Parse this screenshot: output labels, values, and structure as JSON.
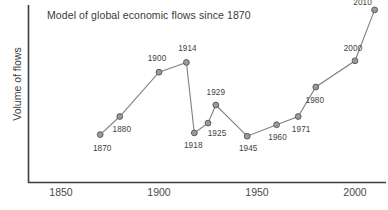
{
  "chart_data": {
    "type": "line",
    "title": "Model of global economic flows since 1870",
    "xlabel": "",
    "ylabel": "Volume of flows",
    "xlim": [
      1843,
      1860
    ],
    "ylim": [
      0,
      100
    ],
    "grid": false,
    "legend": null,
    "x_ticks": [
      "1850",
      "1900",
      "1950",
      "2000"
    ],
    "x_tick_values": [
      1850,
      1900,
      1950,
      2000
    ],
    "y_ticks": [],
    "series": [
      {
        "name": "Volume of flows",
        "color": "#808080",
        "marker": "circle",
        "x": [
          1870,
          1880,
          1900,
          1914,
          1918,
          1925,
          1929,
          1945,
          1960,
          1971,
          1980,
          2000,
          2010
        ],
        "y": [
          21,
          32,
          59,
          65,
          22,
          28,
          39,
          20,
          27,
          32,
          50,
          66,
          97
        ],
        "point_labels": [
          "1870",
          "1880",
          "1900",
          "1914",
          "1918",
          "1925",
          "1929",
          "1945",
          "1960",
          "1971",
          "1980",
          "2000",
          "2010"
        ]
      }
    ]
  },
  "axes": {
    "color": "#3c3c3c"
  }
}
